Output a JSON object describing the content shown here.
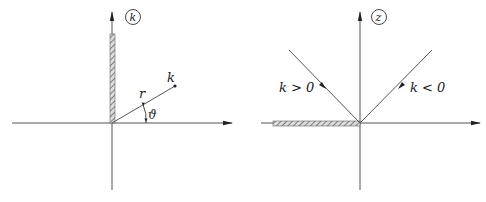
{
  "left_panel": {
    "plane_label": "k",
    "point_label": "k",
    "radius_label": "r",
    "angle_label": "ϑ",
    "cut": "positive imaginary axis (hatched)"
  },
  "right_panel": {
    "plane_label": "z",
    "ray_left_label": "k > 0",
    "ray_right_label": "k < 0",
    "cut": "negative real axis (hatched)"
  },
  "colors": {
    "line": "#555555",
    "hatch": "#777777",
    "text": "#222222"
  }
}
